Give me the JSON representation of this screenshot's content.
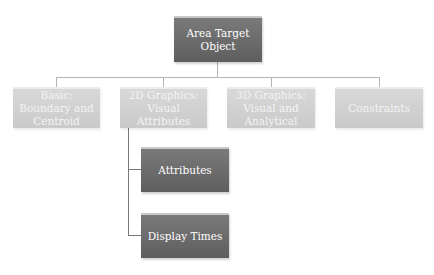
{
  "root": {
    "label": "Area Target Object"
  },
  "level1": [
    {
      "label": "Basic: Boundary and Centroid"
    },
    {
      "label": "2D Graphics: Visual Attributes"
    },
    {
      "label": "3D Graphics: Visual and Analytical"
    },
    {
      "label": "Constraints"
    }
  ],
  "children_2d": [
    {
      "label": "Attributes"
    },
    {
      "label": "Display Times"
    }
  ],
  "colors": {
    "dark_box": "#6b6b6b",
    "light_box": "#d2d2d2",
    "connector": "#b5b5b5"
  }
}
